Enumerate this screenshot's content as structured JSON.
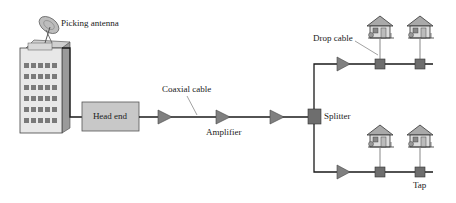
{
  "diagram": {
    "type": "cable-tv-network",
    "labels": {
      "antenna": "Picking antenna",
      "head_end": "Head end",
      "coaxial_cable": "Coaxial cable",
      "amplifier": "Amplifier",
      "splitter": "Splitter",
      "drop_cable": "Drop cable",
      "tap": "Tap"
    },
    "colors": {
      "line": "#1a1a1a",
      "box_fill": "#c8c8c8",
      "amplifier_fill": "#808080",
      "tap_fill": "#6e6e6e",
      "building_fill": "#e6e6e6",
      "window_fill": "#7a7a7a"
    },
    "nodes": [
      {
        "id": "antenna",
        "kind": "dish-antenna-icon"
      },
      {
        "id": "building",
        "kind": "building-icon"
      },
      {
        "id": "head_end",
        "kind": "box"
      },
      {
        "id": "amp1",
        "kind": "amplifier"
      },
      {
        "id": "amp2",
        "kind": "amplifier"
      },
      {
        "id": "amp3",
        "kind": "amplifier"
      },
      {
        "id": "splitter",
        "kind": "splitter"
      },
      {
        "id": "amp_upper",
        "kind": "amplifier"
      },
      {
        "id": "amp_lower",
        "kind": "amplifier"
      },
      {
        "id": "tap_u1",
        "kind": "tap"
      },
      {
        "id": "tap_u2",
        "kind": "tap"
      },
      {
        "id": "tap_l1",
        "kind": "tap"
      },
      {
        "id": "tap_l2",
        "kind": "tap"
      },
      {
        "id": "house_u1",
        "kind": "house"
      },
      {
        "id": "house_u2",
        "kind": "house"
      },
      {
        "id": "house_l1",
        "kind": "house"
      },
      {
        "id": "house_l2",
        "kind": "house"
      }
    ]
  }
}
